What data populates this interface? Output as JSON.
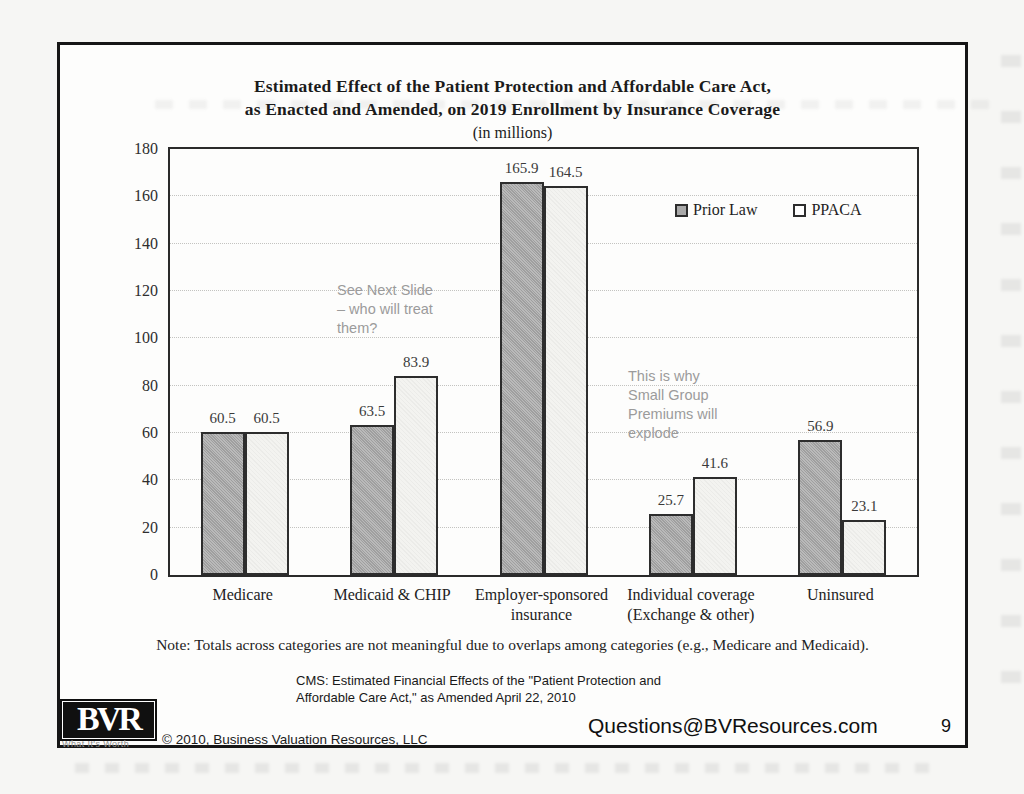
{
  "slide": {
    "title_line1": "Estimated Effect of the Patient Protection and Affordable Care Act,",
    "title_line2": "as Enacted and Amended, on 2019 Enrollment by Insurance Coverage",
    "title_line3": "(in millions)",
    "note": "Note: Totals across categories are not meaningful due to overlaps among categories (e.g., Medicare and Medicaid).",
    "source_line1": "CMS: Estimated Financial Effects of the \"Patient Protection and",
    "source_line2": "Affordable Care Act,\" as Amended April 22, 2010",
    "page_number": "9"
  },
  "footer": {
    "logo_text": "BVR",
    "logo_tagline": "What It's Worth",
    "copyright": "© 2010, Business Valuation Resources, LLC",
    "contact": "Questions@BVResources.com"
  },
  "annotations": [
    {
      "lines": [
        "See Next Slide",
        "– who will treat",
        "them?"
      ]
    },
    {
      "lines": [
        "This is why",
        "Small Group",
        "Premiums will",
        "explode"
      ]
    }
  ],
  "chart_data": {
    "type": "bar",
    "title": "Estimated Effect of the Patient Protection and Affordable Care Act, as Enacted and Amended, on 2019 Enrollment by Insurance Coverage (in millions)",
    "categories": [
      "Medicare",
      "Medicaid & CHIP",
      "Employer-sponsored insurance",
      "Individual coverage (Exchange & other)",
      "Uninsured"
    ],
    "category_label_lines": [
      [
        "Medicare"
      ],
      [
        "Medicaid & CHIP"
      ],
      [
        "Employer-sponsored",
        "insurance"
      ],
      [
        "Individual coverage",
        "(Exchange & other)"
      ],
      [
        "Uninsured"
      ]
    ],
    "series": [
      {
        "name": "Prior Law",
        "values": [
          60.5,
          63.5,
          165.9,
          25.7,
          56.9
        ],
        "color": "#a9a9a9"
      },
      {
        "name": "PPACA",
        "values": [
          60.5,
          83.9,
          164.5,
          41.6,
          23.1
        ],
        "color": "#f3f3f0"
      }
    ],
    "ylabel": "",
    "xlabel": "",
    "ylim": [
      0,
      180
    ],
    "ytick_step": 20,
    "grid": true,
    "legend_position": "top-right-inside"
  }
}
